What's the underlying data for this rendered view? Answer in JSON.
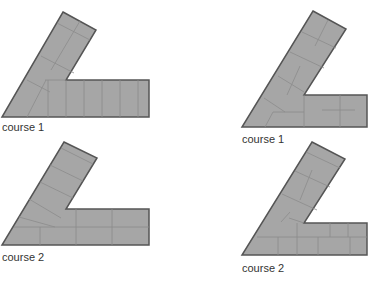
{
  "colors": {
    "fill": "#a6a6a6",
    "joint": "#8c8c8c",
    "outline": "#555555",
    "text": "#333333"
  },
  "figures": [
    {
      "id": "left-course-1",
      "label": "course 1"
    },
    {
      "id": "right-course-1",
      "label": "course 1"
    },
    {
      "id": "left-course-2",
      "label": "course 2"
    },
    {
      "id": "right-course-2",
      "label": "course 2"
    }
  ]
}
